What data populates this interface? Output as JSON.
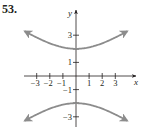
{
  "problem_number": "53.",
  "colors": {
    "axis": "#231f20",
    "curve": "#8c8c8c",
    "vertex_marker": "#231f20"
  },
  "chart_data": {
    "type": "line",
    "title": "",
    "equation": "y^2/4 - x^2/9 = 1",
    "xlabel": "x",
    "ylabel": "y",
    "xlim": [
      -4,
      4
    ],
    "ylim": [
      -4,
      4
    ],
    "x_ticks": [
      -3,
      -2,
      -1,
      1,
      2,
      3
    ],
    "x_tick_labels": [
      "-3",
      "-2",
      "-1",
      "1",
      "2",
      "3"
    ],
    "y_ticks": [
      -3,
      -1,
      1,
      3
    ],
    "y_tick_labels": [
      "-3",
      "-1",
      "1",
      "3"
    ],
    "grid": false,
    "vertices": [
      [
        0,
        2
      ],
      [
        0,
        -2
      ]
    ],
    "series": [
      {
        "name": "upper branch",
        "x": [
          -3.9,
          -3,
          -2,
          -1,
          0,
          1,
          2,
          3,
          3.9
        ],
        "y": [
          3.28,
          2.83,
          2.4,
          2.11,
          2.0,
          2.11,
          2.4,
          2.83,
          3.28
        ]
      },
      {
        "name": "lower branch",
        "x": [
          -3.9,
          -3,
          -2,
          -1,
          0,
          1,
          2,
          3,
          3.9
        ],
        "y": [
          -3.28,
          -2.83,
          -2.4,
          -2.11,
          -2.0,
          -2.11,
          -2.4,
          -2.83,
          -3.28
        ]
      }
    ]
  }
}
